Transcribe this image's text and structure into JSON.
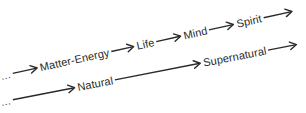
{
  "diagram": {
    "background": "#ffffff",
    "ink_color": "#2a2a2a",
    "rows": [
      {
        "name": "levels-of-being",
        "items": [
          {
            "type": "text",
            "name": "ellipsis-continuation",
            "label": "..."
          },
          {
            "type": "arrow",
            "length": 26
          },
          {
            "type": "text",
            "name": "term-matter-energy",
            "label": "Matter-Energy"
          },
          {
            "type": "arrow",
            "length": 24
          },
          {
            "type": "text",
            "name": "term-life",
            "label": "Life"
          },
          {
            "type": "arrow",
            "length": 26
          },
          {
            "type": "text",
            "name": "term-mind",
            "label": "Mind"
          },
          {
            "type": "arrow",
            "length": 26
          },
          {
            "type": "text",
            "name": "term-spirit",
            "label": "Spirit"
          },
          {
            "type": "arrow",
            "length": 30
          }
        ]
      },
      {
        "name": "natural-supernatural",
        "items": [
          {
            "type": "text",
            "name": "ellipsis-continuation",
            "label": "..."
          },
          {
            "type": "arrow",
            "length": 64
          },
          {
            "type": "text",
            "name": "term-natural",
            "label": "Natural"
          },
          {
            "type": "arrow",
            "length": 88
          },
          {
            "type": "text",
            "name": "term-supernatural",
            "label": "Supernatural"
          },
          {
            "type": "arrow",
            "length": 30
          }
        ]
      }
    ]
  }
}
